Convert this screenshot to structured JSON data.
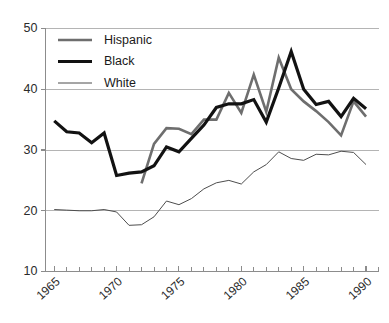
{
  "chart_data": {
    "type": "line",
    "title": "",
    "subtitle": "",
    "xlabel": "",
    "ylabel": "",
    "xlim": [
      1964.3,
      1991.0
    ],
    "ylim": [
      10,
      50
    ],
    "yticks": [
      10,
      20,
      30,
      40,
      50
    ],
    "ytick_labels": [
      "10",
      "20",
      "30",
      "40",
      "50"
    ],
    "xticks": [
      1965,
      1970,
      1975,
      1980,
      1985,
      1990
    ],
    "xtick_labels": [
      "1965",
      "1970",
      "1975",
      "1980",
      "1985",
      "1990"
    ],
    "x_minor_tick_step": 1,
    "grid": "horizontal",
    "legend_position": "top-left-inside",
    "series": [
      {
        "name": "Hispanic",
        "color": "#6e6e6e",
        "width": 2.6,
        "x": [
          1972,
          1973,
          1974,
          1975,
          1976,
          1977,
          1978,
          1979,
          1980,
          1981,
          1982,
          1983,
          1984,
          1985,
          1986,
          1987,
          1988,
          1989,
          1990
        ],
        "values": [
          24.5,
          31.0,
          33.6,
          33.5,
          32.6,
          35.0,
          35.0,
          39.4,
          36.1,
          42.4,
          36.3,
          45.2,
          40.0,
          38.0,
          36.4,
          34.6,
          32.4,
          38.0,
          35.5
        ]
      },
      {
        "name": "Black",
        "color": "#121212",
        "width": 3.2,
        "x": [
          1965,
          1966,
          1967,
          1968,
          1969,
          1970,
          1971,
          1972,
          1973,
          1974,
          1975,
          1976,
          1977,
          1978,
          1979,
          1980,
          1981,
          1982,
          1983,
          1984,
          1985,
          1986,
          1987,
          1988,
          1989,
          1990
        ],
        "values": [
          34.8,
          33.0,
          32.8,
          31.2,
          32.8,
          25.8,
          26.2,
          26.4,
          27.4,
          30.5,
          29.7,
          31.9,
          34.1,
          37.0,
          37.6,
          37.6,
          38.3,
          34.6,
          40.2,
          46.2,
          40.0,
          37.5,
          38.0,
          35.5,
          38.5,
          36.8
        ]
      },
      {
        "name": "White",
        "color": "#4d4d4d",
        "width": 1.0,
        "x": [
          1965,
          1966,
          1967,
          1968,
          1969,
          1970,
          1971,
          1972,
          1973,
          1974,
          1975,
          1976,
          1977,
          1978,
          1979,
          1980,
          1981,
          1982,
          1983,
          1984,
          1985,
          1986,
          1987,
          1988,
          1989,
          1990
        ],
        "values": [
          20.2,
          20.1,
          20.0,
          20.0,
          20.2,
          19.8,
          17.6,
          17.7,
          19.0,
          21.6,
          21.0,
          22.0,
          23.6,
          24.6,
          25.0,
          24.4,
          26.4,
          27.6,
          29.7,
          28.6,
          28.3,
          29.3,
          29.2,
          29.8,
          29.6,
          27.6
        ]
      }
    ],
    "legend": [
      {
        "label": "Hispanic"
      },
      {
        "label": "Black"
      },
      {
        "label": "White"
      }
    ]
  }
}
